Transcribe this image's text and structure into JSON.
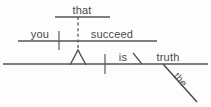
{
  "diagram": {
    "type": "reed-kellogg-sentence-diagram",
    "sentence": "That you succeed is the truth.",
    "background_color": "#fdfdfd",
    "ink_color": "#555555",
    "text_color": "#4a4a4a",
    "words": {
      "subordinator": "that",
      "clause_subject": "you",
      "clause_verb": "succeed",
      "main_verb": "is",
      "predicate_nominative": "truth",
      "article_modifier": "the"
    },
    "labels": [
      {
        "id": "that",
        "text": "that",
        "x": 82,
        "y": 14,
        "anchor": "middle"
      },
      {
        "id": "you",
        "text": "you",
        "x": 40,
        "y": 38,
        "anchor": "middle"
      },
      {
        "id": "succeed",
        "text": "succeed",
        "x": 112,
        "y": 38,
        "anchor": "middle"
      },
      {
        "id": "is",
        "text": "is",
        "x": 123,
        "y": 61,
        "anchor": "middle"
      },
      {
        "id": "truth",
        "text": "truth",
        "x": 168,
        "y": 61,
        "anchor": "middle"
      },
      {
        "id": "the",
        "text": "the",
        "x": 178,
        "y": 82,
        "anchor": "middle",
        "rotation": 48
      }
    ],
    "strokes": {
      "clause_top_baseline": {
        "x1": 55,
        "y1": 17,
        "x2": 110,
        "y2": 17
      },
      "clause_main_baseline": {
        "x1": 18,
        "y1": 41,
        "x2": 157,
        "y2": 41
      },
      "clause_divider": {
        "x1": 59,
        "y1": 31,
        "x2": 59,
        "y2": 50
      },
      "subordinator_dashes": {
        "x1": 78,
        "y1": 17,
        "x2": 78,
        "y2": 50
      },
      "clause_peak": {
        "apex_x": 78,
        "apex_y": 50,
        "left_x": 70,
        "left_y": 65,
        "right_x": 86,
        "right_y": 65
      },
      "sentence_baseline": {
        "x1": 3,
        "y1": 64,
        "x2": 208,
        "y2": 64
      },
      "predicate_divider": {
        "x1": 105,
        "y1": 54,
        "x2": 105,
        "y2": 74
      },
      "predicate_nom_slant": {
        "x1": 133,
        "y1": 53,
        "x2": 142,
        "y2": 64
      },
      "article_diagonal": {
        "x1": 163,
        "y1": 64,
        "x2": 197,
        "y2": 102
      }
    }
  }
}
